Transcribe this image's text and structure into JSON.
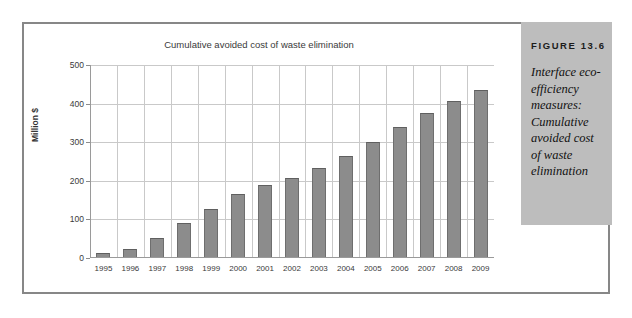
{
  "figure": {
    "caption_label": "FIGURE 13.6",
    "caption_text": "Interface eco-efficiency measures: Cumulative avoided cost of waste elimination"
  },
  "colors": {
    "bar": "#8c8c8c",
    "bar_edge": "#6e6e6e",
    "grid": "#c9c9c9",
    "axis": "#9a9a9a",
    "panel": "#bdbdbd",
    "frame": "#878787"
  },
  "chart_data": {
    "type": "bar",
    "title": "Cumulative avoided cost of waste elimination",
    "xlabel": "",
    "ylabel": "Million $",
    "ylim": [
      0,
      500
    ],
    "yticks": [
      0,
      100,
      200,
      300,
      400,
      500
    ],
    "grid": true,
    "legend": null,
    "categories": [
      "1995",
      "1996",
      "1997",
      "1998",
      "1999",
      "2000",
      "2001",
      "2002",
      "2003",
      "2004",
      "2005",
      "2006",
      "2007",
      "2008",
      "2009"
    ],
    "values": [
      10,
      22,
      50,
      89,
      124,
      163,
      186,
      204,
      231,
      262,
      297,
      337,
      373,
      405,
      432
    ]
  }
}
